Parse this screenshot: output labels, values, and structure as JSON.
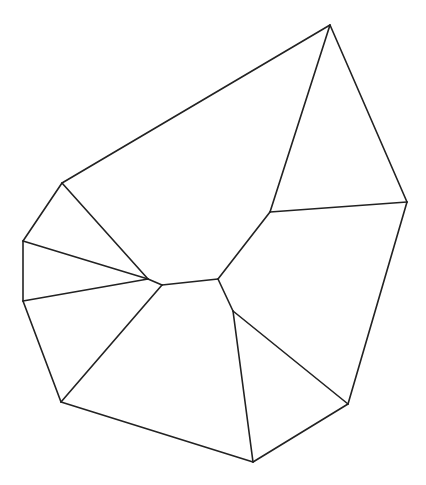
{
  "diagram": {
    "type": "planar-graph",
    "line_color": "#222222",
    "background_color": "#ffffff",
    "vertices": [
      {
        "id": "A",
        "x": 330,
        "y": 25
      },
      {
        "id": "B",
        "x": 407,
        "y": 202
      },
      {
        "id": "C",
        "x": 348,
        "y": 404
      },
      {
        "id": "D",
        "x": 253,
        "y": 462
      },
      {
        "id": "E",
        "x": 61,
        "y": 402
      },
      {
        "id": "F",
        "x": 23,
        "y": 301
      },
      {
        "id": "G",
        "x": 23,
        "y": 241
      },
      {
        "id": "H",
        "x": 62,
        "y": 183
      },
      {
        "id": "I",
        "x": 270,
        "y": 212
      },
      {
        "id": "J",
        "x": 218,
        "y": 279
      },
      {
        "id": "K",
        "x": 162,
        "y": 285
      },
      {
        "id": "L",
        "x": 148,
        "y": 279
      },
      {
        "id": "M",
        "x": 233,
        "y": 311
      }
    ],
    "edges": [
      [
        "A",
        "B"
      ],
      [
        "B",
        "C"
      ],
      [
        "C",
        "D"
      ],
      [
        "D",
        "E"
      ],
      [
        "E",
        "F"
      ],
      [
        "F",
        "G"
      ],
      [
        "G",
        "H"
      ],
      [
        "H",
        "A"
      ],
      [
        "A",
        "I"
      ],
      [
        "I",
        "B"
      ],
      [
        "I",
        "J"
      ],
      [
        "J",
        "K"
      ],
      [
        "K",
        "L"
      ],
      [
        "H",
        "L"
      ],
      [
        "G",
        "L"
      ],
      [
        "F",
        "L"
      ],
      [
        "K",
        "E"
      ],
      [
        "J",
        "M"
      ],
      [
        "M",
        "C"
      ],
      [
        "M",
        "D"
      ]
    ]
  }
}
